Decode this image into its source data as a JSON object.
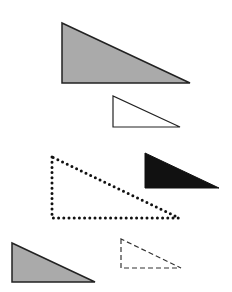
{
  "diagram": {
    "title": "",
    "shapes": [
      {
        "id": "gray-large",
        "type": "right-triangle",
        "fill": "#aaaaaa",
        "stroke": "#222222",
        "style": "solid",
        "points": "62,23 62,83 190,83"
      },
      {
        "id": "white-small",
        "type": "right-triangle",
        "fill": "#ffffff",
        "stroke": "#222222",
        "style": "solid",
        "points": "113,96 113,127 180,127"
      },
      {
        "id": "dotted-large",
        "type": "right-triangle",
        "fill": "none",
        "stroke": "#111111",
        "style": "dotted",
        "points": "52,157 52,218 179,218"
      },
      {
        "id": "black-small",
        "type": "right-triangle",
        "fill": "#111111",
        "stroke": "#111111",
        "style": "solid",
        "points": "145,153 145,188 219,188"
      },
      {
        "id": "gray-small",
        "type": "right-triangle",
        "fill": "#aaaaaa",
        "stroke": "#222222",
        "style": "solid",
        "points": "12,243 12,282 95,282"
      },
      {
        "id": "dashed-small",
        "type": "right-triangle",
        "fill": "#ffffff",
        "stroke": "#333333",
        "style": "dashed",
        "points": "121,239 121,268 181,268"
      }
    ]
  }
}
